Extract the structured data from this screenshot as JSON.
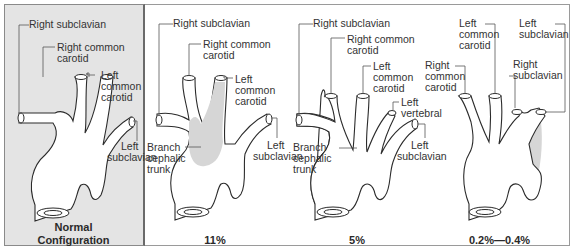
{
  "panels": [
    {
      "id": "normal",
      "caption_line1": "Normal",
      "caption_line2": "Configuration",
      "background": "#e4e4e4",
      "labels": {
        "right_subclavian": "Right subclavian",
        "right_common_carotid_1": "Right common",
        "right_common_carotid_2": "carotid",
        "left_common_carotid_1": "Left",
        "left_common_carotid_2": "common",
        "left_common_carotid_3": "carotid",
        "left_subclavian_1": "Left",
        "left_subclavian_2": "subclavian"
      }
    },
    {
      "id": "bovine",
      "caption": "11%",
      "labels": {
        "right_subclavian": "Right subclavian",
        "right_common_carotid_1": "Right common",
        "right_common_carotid_2": "carotid",
        "left_common_carotid_1": "Left",
        "left_common_carotid_2": "common",
        "left_common_carotid_3": "carotid",
        "branch_1": "Branch",
        "branch_2": "cephalic",
        "branch_3": "trunk",
        "left_subclavian_1": "Left",
        "left_subclavian_2": "subclavian"
      }
    },
    {
      "id": "vertebral",
      "caption": "5%",
      "labels": {
        "right_subclavian": "Right subclavian",
        "right_common_carotid_1": "Right common",
        "right_common_carotid_2": "carotid",
        "left_common_carotid_1": "Left",
        "left_common_carotid_2": "common",
        "left_common_carotid_3": "carotid",
        "left_vertebral_1": "Left",
        "left_vertebral_2": "vertebral",
        "branch_1": "Branch",
        "branch_2": "cephalic",
        "branch_3": "trunk",
        "left_subclavian_1": "Left",
        "left_subclavian_2": "subclavian"
      }
    },
    {
      "id": "aberrant",
      "caption": "0.2%—0.4%",
      "labels": {
        "left_common_carotid_1": "Left",
        "left_common_carotid_2": "common",
        "left_common_carotid_3": "carotid",
        "left_subclavian_1": "Left",
        "left_subclavian_2": "subclavian",
        "right_common_carotid_1": "Right",
        "right_common_carotid_2": "common",
        "right_common_carotid_3": "carotid",
        "right_subclavian_1": "Right",
        "right_subclavian_2": "subclavian"
      }
    }
  ]
}
